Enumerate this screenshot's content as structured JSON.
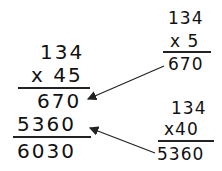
{
  "main": {
    "multiplicand": "134",
    "multiplier": "x 45",
    "partial1": "670",
    "partial2": "5360",
    "total": "6030"
  },
  "side_top": {
    "multiplicand": "134",
    "multiplier": "x 5",
    "product": "670"
  },
  "side_bottom": {
    "multiplicand": "134",
    "multiplier": "x40",
    "product": "5360"
  }
}
